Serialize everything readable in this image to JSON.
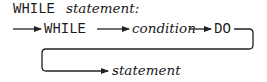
{
  "title": {
    "keyword": "WHILE",
    "label": "statement:"
  },
  "diagram": {
    "type": "syntax-diagram",
    "nodes": [
      {
        "id": "while",
        "text": "WHILE",
        "kind": "terminal"
      },
      {
        "id": "condition",
        "text": "condition",
        "kind": "nonterminal"
      },
      {
        "id": "do",
        "text": "DO",
        "kind": "terminal"
      },
      {
        "id": "statement",
        "text": "statement",
        "kind": "nonterminal"
      }
    ],
    "edges": [
      {
        "from": "start",
        "to": "while"
      },
      {
        "from": "while",
        "to": "condition"
      },
      {
        "from": "condition",
        "to": "do"
      },
      {
        "from": "do",
        "to": "statement"
      }
    ]
  },
  "colors": {
    "ink": "#1a1a1a",
    "background": "#ffffff"
  }
}
